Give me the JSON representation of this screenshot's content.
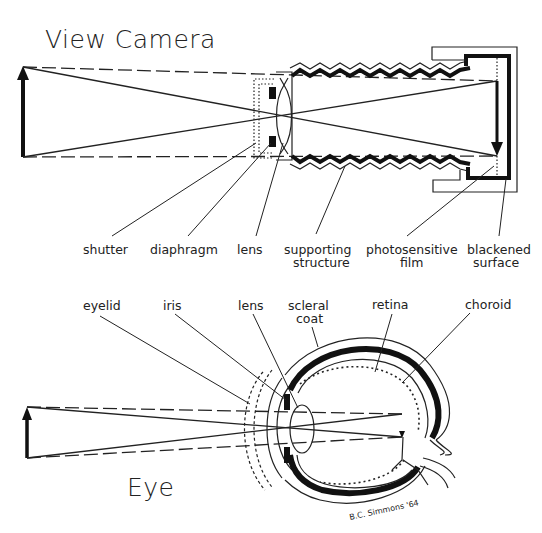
{
  "camera": {
    "title": "View Camera",
    "labels": {
      "shutter": "shutter",
      "diaphragm": "diaphragm",
      "lens": "lens",
      "supporting_1": "supporting",
      "supporting_2": "structure",
      "photosensitive_1": "photosensitive",
      "photosensitive_2": "film",
      "blackened_1": "blackened",
      "blackened_2": "surface"
    }
  },
  "eye": {
    "title": "Eye",
    "labels": {
      "eyelid": "eyelid",
      "iris": "iris",
      "lens": "lens",
      "scleral_1": "scleral",
      "scleral_2": "coat",
      "retina": "retina",
      "choroid": "choroid"
    }
  },
  "signature": "B.C. Simmons '64",
  "colors": {
    "ink": "#222222",
    "paper": "#ffffff"
  }
}
